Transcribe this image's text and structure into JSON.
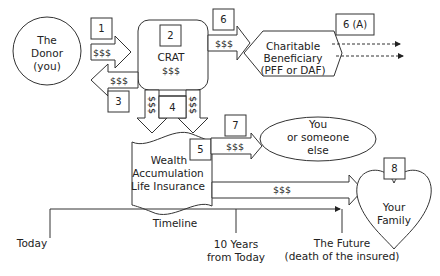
{
  "diagram": {
    "donor": {
      "line1": "The",
      "line2": "Donor",
      "line3": "(you)"
    },
    "crat": {
      "num": "2",
      "label": "CRAT",
      "amount": "$$$"
    },
    "charity": {
      "line1": "Charitable",
      "line2": "Beneficiary",
      "line3": "(PFF or DAF)"
    },
    "insurance": {
      "line1": "Wealth",
      "line2": "Accumulation",
      "line3": "Life Insurance"
    },
    "someone": {
      "line1": "You",
      "line2": "or someone",
      "line3": "else"
    },
    "family": {
      "line1": "Your",
      "line2": "Family"
    },
    "steps": {
      "s1": "1",
      "s3": "3",
      "s4": "4",
      "s5": "5",
      "s6": "6",
      "s6a": "6 (A)",
      "s7": "7",
      "s8": "8"
    },
    "arrows": {
      "donor_to_crat": "$$$",
      "crat_to_donor": "$$$",
      "crat_to_charity": "$$$",
      "crat_down_left": "$$$",
      "crat_down_right": "$$$",
      "insurance_to_someone": "$$$",
      "insurance_to_family": "$$$"
    },
    "timeline": {
      "title": "Timeline",
      "today": "Today",
      "ten_years_1": "10 Years",
      "ten_years_2": "from Today",
      "future_1": "The Future",
      "future_2": "(death of the insured)"
    }
  }
}
